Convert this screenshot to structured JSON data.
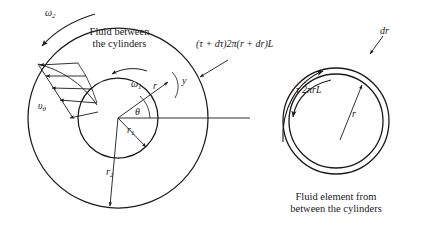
{
  "figure": {
    "title_hidden": "Concentric cylinder viscometer — Couette flow diagram",
    "left_diagram": {
      "caption_line1": "Fluid between",
      "caption_line2": "the cylinders",
      "labels": {
        "omega_outer": "ω",
        "omega_outer_sub": "2",
        "omega_inner": "ω",
        "omega_inner_sub": "1",
        "velocity_profile": "υ",
        "velocity_profile_sub": "θ",
        "radius_r": "r",
        "coordinate_y": "y",
        "angle_theta": "θ",
        "radius_inner": "r",
        "radius_inner_sub": "1",
        "radius_outer": "r",
        "radius_outer_sub": "2"
      }
    },
    "right_diagram": {
      "caption_line1": "Fluid element from",
      "caption_line2": "between the cylinders",
      "labels": {
        "stress_outer": "(τ + dτ)2π(r + dr)L",
        "stress_inner": "τ 2πrL",
        "thickness": "dr",
        "radius_r": "r"
      }
    },
    "colors": {
      "ink": "#1a1a1a",
      "background": "#ffffff"
    }
  }
}
